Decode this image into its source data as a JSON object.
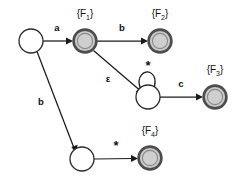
{
  "diagram": {
    "kind": "finite-automaton-state-diagram",
    "colors": {
      "accepting_fill": "#c9c9c9",
      "accepting_ring": "#4d4d4d",
      "plain_fill": "#ffffff",
      "stroke": "#1a1a1a",
      "background": "#ffffff"
    },
    "states": [
      {
        "id": "start",
        "label": "",
        "kind": "plain",
        "cx": 31,
        "cy": 41,
        "r": 12
      },
      {
        "id": "f1",
        "label": "{F1}",
        "kind": "accepting",
        "cx": 85,
        "cy": 41,
        "r": 12
      },
      {
        "id": "f2",
        "label": "{F2}",
        "kind": "accepting",
        "cx": 160,
        "cy": 41,
        "r": 12
      },
      {
        "id": "loop",
        "label": "",
        "kind": "plain",
        "cx": 148,
        "cy": 97,
        "r": 12
      },
      {
        "id": "f3",
        "label": "{F3}",
        "kind": "accepting",
        "cx": 215,
        "cy": 97,
        "r": 12
      },
      {
        "id": "mid",
        "label": "",
        "kind": "plain",
        "cx": 82,
        "cy": 159,
        "r": 12
      },
      {
        "id": "f4",
        "label": "{F4}",
        "kind": "accepting",
        "cx": 150,
        "cy": 158,
        "r": 12
      }
    ],
    "state_labels": [
      {
        "name": "f1-label",
        "text": "{F",
        "sub": "1",
        "tail": "}",
        "x": 85,
        "y": 17
      },
      {
        "name": "f2-label",
        "text": "{F",
        "sub": "2",
        "tail": "}",
        "x": 160,
        "y": 17
      },
      {
        "name": "f3-label",
        "text": "{F",
        "sub": "3",
        "tail": "}",
        "x": 215,
        "y": 73
      },
      {
        "name": "f4-label",
        "text": "{F",
        "sub": "4",
        "tail": "}",
        "x": 150,
        "y": 134
      }
    ],
    "transitions": [
      {
        "id": "t-a",
        "from": "start",
        "to": "f1",
        "symbol": "a",
        "label_x": 57,
        "label_y": 31
      },
      {
        "id": "t-b-top",
        "from": "f1",
        "to": "f2",
        "symbol": "b",
        "label_x": 122,
        "label_y": 31
      },
      {
        "id": "t-epsilon",
        "from": "f1",
        "to": "loop",
        "symbol": "ε",
        "label_x": 108,
        "label_y": 82
      },
      {
        "id": "t-star-loop",
        "from": "loop",
        "to": "loop",
        "symbol": "*",
        "label_x": 148,
        "label_y": 70
      },
      {
        "id": "t-c",
        "from": "loop",
        "to": "f3",
        "symbol": "c",
        "label_x": 181,
        "label_y": 87
      },
      {
        "id": "t-b-down",
        "from": "start",
        "to": "mid",
        "symbol": "b",
        "label_x": 41,
        "label_y": 105
      },
      {
        "id": "t-star-bot",
        "from": "mid",
        "to": "f4",
        "symbol": "*",
        "label_x": 116,
        "label_y": 148
      }
    ],
    "symbols": {
      "a": "a",
      "b": "b",
      "c": "c",
      "epsilon": "ε",
      "star": "*"
    }
  }
}
